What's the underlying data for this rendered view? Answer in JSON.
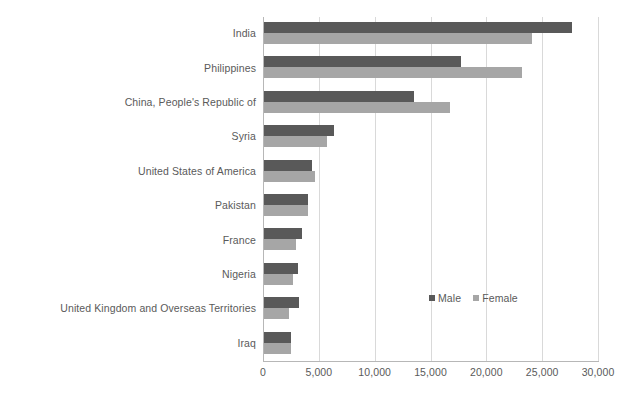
{
  "chart_data": {
    "type": "bar",
    "orientation": "horizontal",
    "title": "",
    "subtitle": "",
    "xlabel": "",
    "ylabel": "",
    "xlim": [
      0,
      30000
    ],
    "xticks": [
      0,
      5000,
      10000,
      15000,
      20000,
      25000,
      30000
    ],
    "xtick_labels": [
      "0",
      "5,000",
      "10,000",
      "15,000",
      "20,000",
      "25,000",
      "30,000"
    ],
    "grid": true,
    "grid_axis": "x",
    "legend_position": "inside-right",
    "categories": [
      "India",
      "Philippines",
      "China, People's Republic of",
      "Syria",
      "United States of America",
      "Pakistan",
      "France",
      "Nigeria",
      "United Kingdom and Overseas Territories",
      "Iraq"
    ],
    "series": [
      {
        "name": "Male",
        "color": "#595959",
        "values": [
          27600,
          17600,
          13400,
          6250,
          4300,
          3900,
          3400,
          3000,
          3150,
          2400
        ]
      },
      {
        "name": "Female",
        "color": "#a6a6a6",
        "values": [
          24000,
          23100,
          16700,
          5600,
          4550,
          3900,
          2900,
          2600,
          2250,
          2400
        ]
      }
    ],
    "legend": [
      {
        "label": "Male",
        "color": "#595959"
      },
      {
        "label": "Female",
        "color": "#a6a6a6"
      }
    ],
    "colors": {
      "male": "#595959",
      "female": "#a6a6a6",
      "gridline": "#d9d9d9",
      "axis": "#b7b7b7",
      "text": "#5a5a5a",
      "background": "#ffffff"
    }
  }
}
